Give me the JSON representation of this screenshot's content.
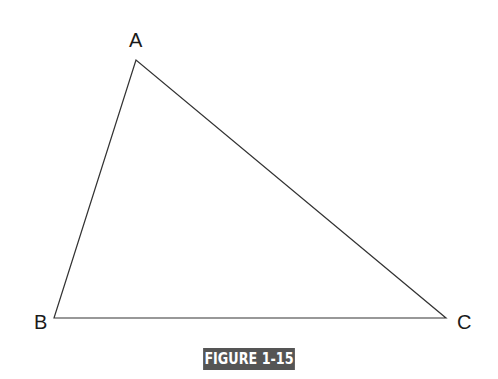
{
  "figure": {
    "caption": "FIGURE 1-15",
    "caption_bg": "#555555",
    "caption_color": "#ffffff",
    "line_color": "#333333"
  },
  "vertices": [
    {
      "label": "A",
      "x": 136,
      "y": 60
    },
    {
      "label": "B",
      "x": 54,
      "y": 318
    },
    {
      "label": "C",
      "x": 446,
      "y": 318
    }
  ]
}
